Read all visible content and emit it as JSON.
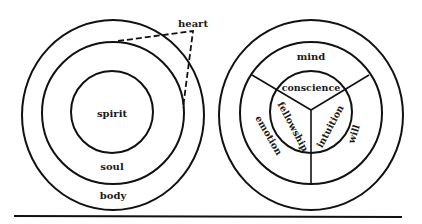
{
  "colors": {
    "stroke": "#111111",
    "background": "#ffffff",
    "text": "#1a1a1a"
  },
  "left_diagram": {
    "labels": {
      "spirit": "spirit",
      "soul": "soul",
      "body": "body",
      "heart": "heart"
    }
  },
  "right_diagram": {
    "labels": {
      "mind": "mind",
      "conscience": "conscience",
      "fellowship": "fellowship",
      "intuition": "intuition",
      "emotion": "emotion",
      "will": "will"
    }
  }
}
